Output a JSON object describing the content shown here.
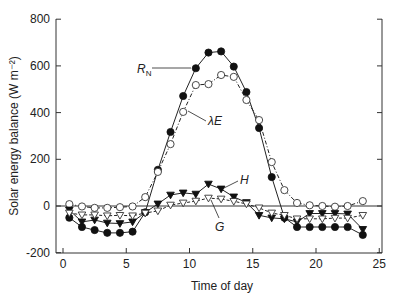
{
  "chart_data": {
    "type": "line",
    "title": "",
    "xlabel": "Time of day",
    "ylabel": "Solar energy balance (W m⁻²)",
    "xlim": [
      -1,
      25
    ],
    "ylim": [
      -200,
      800
    ],
    "xticks": [
      0,
      5,
      10,
      15,
      20,
      25
    ],
    "yticks": [
      -200,
      0,
      200,
      400,
      600,
      800
    ],
    "grid": false,
    "zero_line": true,
    "legend": "inline labels",
    "series": [
      {
        "name": "RN",
        "label_main": "R",
        "label_sub": "N",
        "marker": "filled-circle",
        "line": "solid",
        "x": [
          0.5,
          1.5,
          2.5,
          3.5,
          4.5,
          5.5,
          6.5,
          7.5,
          8.5,
          9.5,
          10.5,
          11.5,
          12.5,
          13.5,
          14.5,
          15.5,
          16.5,
          17.5,
          18.5,
          19.5,
          20.5,
          21.5,
          22.5,
          23.7
        ],
        "values": [
          -50,
          -90,
          -103,
          -115,
          -115,
          -110,
          -27,
          155,
          317,
          471,
          590,
          657,
          662,
          597,
          488,
          334,
          124,
          -50,
          -90,
          -90,
          -90,
          -90,
          -90,
          -124
        ]
      },
      {
        "name": "λE",
        "label_main": "λE",
        "marker": "open-circle",
        "line": "dash-dot",
        "x": [
          0.5,
          1.5,
          2.5,
          3.5,
          4.5,
          5.5,
          6.5,
          7.5,
          8.5,
          9.5,
          10.5,
          11.5,
          12.5,
          13.5,
          14.5,
          15.5,
          16.5,
          17.5,
          18.5,
          19.5,
          20.5,
          21.5,
          22.5,
          23.7
        ],
        "values": [
          8,
          -2,
          -8,
          -8,
          -5,
          -2,
          38,
          146,
          265,
          403,
          518,
          522,
          561,
          553,
          454,
          368,
          188,
          68,
          13,
          3,
          0,
          -3,
          0,
          21
        ]
      },
      {
        "name": "H",
        "label_main": "H",
        "marker": "filled-triangle-down",
        "line": "solid",
        "x": [
          0.5,
          1.5,
          2.5,
          3.5,
          4.5,
          5.5,
          6.5,
          7.5,
          8.5,
          9.5,
          10.5,
          11.5,
          12.5,
          13.5,
          14.5,
          15.5,
          16.5,
          17.5,
          18.5,
          19.5,
          20.5,
          21.5,
          22.5,
          23.7
        ],
        "values": [
          -17,
          -68,
          -60,
          -73,
          -75,
          -68,
          -28,
          9,
          47,
          56,
          51,
          94,
          73,
          39,
          15,
          -40,
          -51,
          -55,
          -68,
          -32,
          -32,
          -32,
          -34,
          -100
        ]
      },
      {
        "name": "G",
        "label_main": "G",
        "marker": "open-triangle-down",
        "line": "dashed",
        "x": [
          0.5,
          1.5,
          2.5,
          3.5,
          4.5,
          5.5,
          6.5,
          7.5,
          8.5,
          9.5,
          10.5,
          11.5,
          12.5,
          13.5,
          14.5,
          15.5,
          16.5,
          17.5,
          18.5,
          19.5,
          20.5,
          21.5,
          22.5,
          23.7
        ],
        "values": [
          -30,
          -38,
          -38,
          -42,
          -40,
          -42,
          -30,
          -21,
          4,
          13,
          21,
          34,
          30,
          20,
          9,
          -8,
          -30,
          -40,
          -55,
          -55,
          -55,
          -52,
          -52,
          -40
        ]
      }
    ],
    "annotations": [
      {
        "text": "RN",
        "series": "RN",
        "x": 5.6,
        "y": 590
      },
      {
        "text": "λE",
        "series": "λE",
        "x": 11.6,
        "y": 390
      },
      {
        "text": "H",
        "series": "H",
        "x": 14.0,
        "y": 115
      },
      {
        "text": "G",
        "series": "G",
        "x": 12.0,
        "y": -70
      }
    ]
  }
}
